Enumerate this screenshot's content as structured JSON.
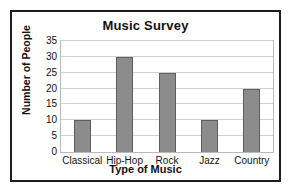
{
  "chart_data": {
    "type": "bar",
    "title": "Music Survey",
    "xlabel": "Type of Music",
    "ylabel": "Number of People",
    "categories": [
      "Classical",
      "Hip-Hop",
      "Rock",
      "Jazz",
      "Country"
    ],
    "values": [
      10,
      30,
      25,
      10,
      20
    ],
    "ylim": [
      0,
      35
    ],
    "ytick_step": 5,
    "yticks": [
      0,
      5,
      10,
      15,
      20,
      25,
      30,
      35
    ],
    "grid": true,
    "legend": false,
    "colors": {
      "bar_fill": "#8c8c8c",
      "bar_border": "#5d5d5d",
      "gridline": "#cfcfcf",
      "frame": "#1d1d1d",
      "plot_border": "#b9b9b9",
      "background": "#ffffff",
      "text": "#111111"
    }
  }
}
